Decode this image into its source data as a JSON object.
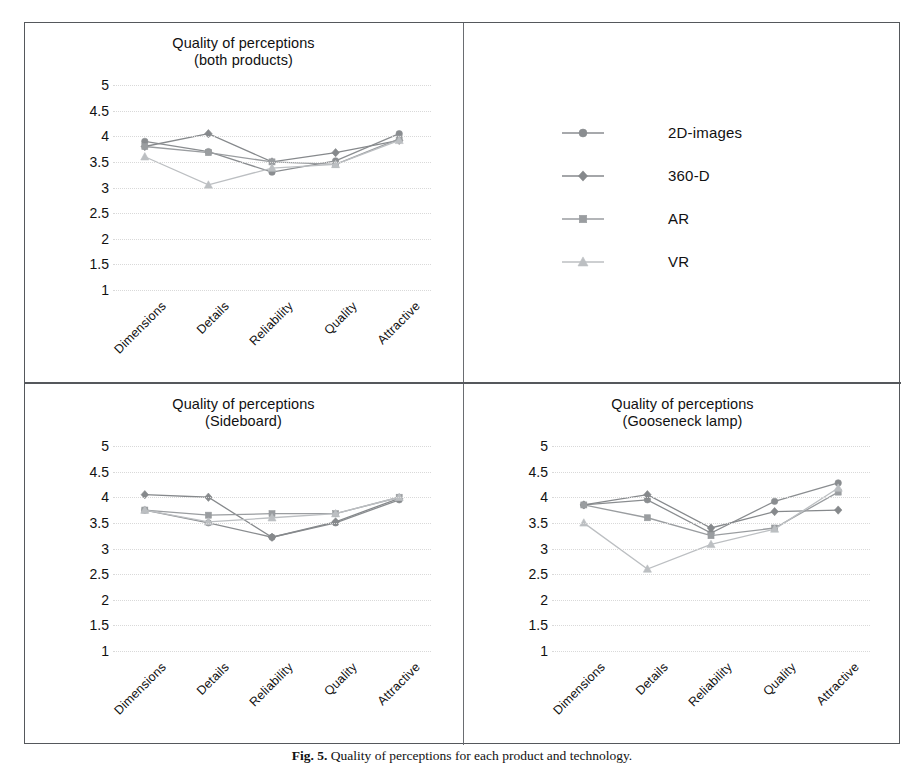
{
  "figure": {
    "caption_prefix": "Fig. 5.",
    "caption_text": "Quality of perceptions for each product and technology."
  },
  "axis": {
    "y_ticks": [
      "5",
      "4.5",
      "4",
      "3.5",
      "3",
      "2.5",
      "2",
      "1.5",
      "1"
    ],
    "x_ticks": [
      "Dimensions",
      "Details",
      "Reliability",
      "Quality",
      "Attractive"
    ],
    "ymin": 1,
    "ymax": 5
  },
  "legend": {
    "title": "",
    "items": [
      {
        "label": "2D-images",
        "marker": "circle",
        "color": "#8a8d90"
      },
      {
        "label": "360-D",
        "marker": "diamond",
        "color": "#86898c"
      },
      {
        "label": "AR",
        "marker": "square",
        "color": "#9a9da0"
      },
      {
        "label": "VR",
        "marker": "triangle",
        "color": "#bcbfc2"
      }
    ]
  },
  "panels": {
    "both": {
      "title_line1": "Quality of perceptions",
      "title_line2": "(both products)"
    },
    "sideboard": {
      "title_line1": "Quality of perceptions",
      "title_line2": "(Sideboard)"
    },
    "gooseneck": {
      "title_line1": "Quality of perceptions",
      "title_line2": "(Gooseneck lamp)"
    }
  },
  "chart_data": [
    {
      "id": "both",
      "type": "line",
      "title": "Quality of perceptions (both products)",
      "xlabel": "",
      "ylabel": "",
      "ylim": [
        1,
        5
      ],
      "ytick_step": 0.5,
      "grid": true,
      "legend_position": "external-top-right",
      "categories": [
        "Dimensions",
        "Details",
        "Reliability",
        "Quality",
        "Attractive"
      ],
      "series": [
        {
          "name": "2D-images",
          "marker": "circle",
          "color": "#8a8d90",
          "values": [
            3.9,
            3.7,
            3.3,
            3.52,
            4.05
          ]
        },
        {
          "name": "360-D",
          "marker": "diamond",
          "color": "#86898c",
          "values": [
            3.8,
            4.05,
            3.5,
            3.68,
            3.92
          ]
        },
        {
          "name": "AR",
          "marker": "square",
          "color": "#9a9da0",
          "values": [
            3.8,
            3.68,
            3.5,
            3.45,
            3.95
          ]
        },
        {
          "name": "VR",
          "marker": "triangle",
          "color": "#bcbfc2",
          "values": [
            3.6,
            3.05,
            3.38,
            3.45,
            3.92
          ]
        }
      ]
    },
    {
      "id": "sideboard",
      "type": "line",
      "title": "Quality of perceptions (Sideboard)",
      "xlabel": "",
      "ylabel": "",
      "ylim": [
        1,
        5
      ],
      "ytick_step": 0.5,
      "grid": true,
      "legend_position": "none",
      "categories": [
        "Dimensions",
        "Details",
        "Reliability",
        "Quality",
        "Attractive"
      ],
      "series": [
        {
          "name": "2D-images",
          "marker": "circle",
          "color": "#8a8d90",
          "values": [
            3.75,
            3.5,
            3.22,
            3.5,
            3.95
          ]
        },
        {
          "name": "360-D",
          "marker": "diamond",
          "color": "#86898c",
          "values": [
            4.05,
            4.0,
            3.22,
            3.52,
            3.98
          ]
        },
        {
          "name": "AR",
          "marker": "square",
          "color": "#9a9da0",
          "values": [
            3.75,
            3.65,
            3.68,
            3.68,
            4.0
          ]
        },
        {
          "name": "VR",
          "marker": "triangle",
          "color": "#bcbfc2",
          "values": [
            3.75,
            3.52,
            3.6,
            3.68,
            4.0
          ]
        }
      ]
    },
    {
      "id": "gooseneck",
      "type": "line",
      "title": "Quality of perceptions (Gooseneck lamp)",
      "xlabel": "",
      "ylabel": "",
      "ylim": [
        1,
        5
      ],
      "ytick_step": 0.5,
      "grid": true,
      "legend_position": "none",
      "categories": [
        "Dimensions",
        "Details",
        "Reliability",
        "Quality",
        "Attractive"
      ],
      "series": [
        {
          "name": "2D-images",
          "marker": "circle",
          "color": "#8a8d90",
          "values": [
            3.85,
            3.95,
            3.3,
            3.92,
            4.28
          ]
        },
        {
          "name": "360-D",
          "marker": "diamond",
          "color": "#86898c",
          "values": [
            3.85,
            4.05,
            3.4,
            3.72,
            3.75
          ]
        },
        {
          "name": "AR",
          "marker": "square",
          "color": "#9a9da0",
          "values": [
            3.85,
            3.6,
            3.25,
            3.4,
            4.1
          ]
        },
        {
          "name": "VR",
          "marker": "triangle",
          "color": "#bcbfc2",
          "values": [
            3.5,
            2.6,
            3.08,
            3.38,
            4.18
          ]
        }
      ]
    }
  ]
}
